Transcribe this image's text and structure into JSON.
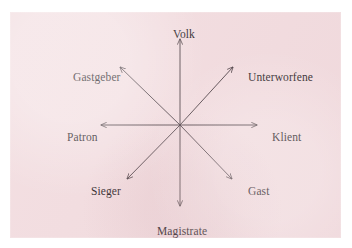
{
  "figure": {
    "type": "radial-star-diagram",
    "background_color": "#f2dcdf",
    "line_color": "#3a2e33",
    "text_color": "#1a1418",
    "center": {
      "x": 180,
      "y": 125
    },
    "arrow_style": "open-v-arrowhead",
    "arrow_direction": "outward-from-center"
  },
  "nodes": [
    {
      "id": "volk",
      "label": "Volk",
      "direction": "up",
      "angle_deg": 90,
      "tip": {
        "x": 180,
        "y": 38
      }
    },
    {
      "id": "unterworfene",
      "label": "Unterworfene",
      "direction": "up-right",
      "angle_deg": 45,
      "tip": {
        "x": 233,
        "y": 66
      }
    },
    {
      "id": "klient",
      "label": "Klient",
      "direction": "right",
      "angle_deg": 0,
      "tip": {
        "x": 258,
        "y": 125
      }
    },
    {
      "id": "gast",
      "label": "Gast",
      "direction": "down-right",
      "angle_deg": -45,
      "tip": {
        "x": 232,
        "y": 178
      }
    },
    {
      "id": "magistrate",
      "label": "Magistrate",
      "direction": "down",
      "angle_deg": -90,
      "tip": {
        "x": 180,
        "y": 205
      }
    },
    {
      "id": "sieger",
      "label": "Sieger",
      "direction": "down-left",
      "angle_deg": -135,
      "tip": {
        "x": 127,
        "y": 178
      }
    },
    {
      "id": "patron",
      "label": "Patron",
      "direction": "left",
      "angle_deg": 180,
      "tip": {
        "x": 100,
        "y": 125
      }
    },
    {
      "id": "gastgeber",
      "label": "Gastgeber",
      "direction": "up-left",
      "angle_deg": 135,
      "tip": {
        "x": 120,
        "y": 66
      }
    }
  ]
}
